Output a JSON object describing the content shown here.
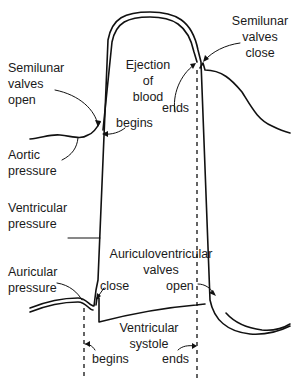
{
  "diagram": {
    "curves": {
      "aortic": "Aortic pressure",
      "ventricular": "Ventricular pressure",
      "auricular": "Auricular pressure"
    },
    "labels": {
      "semilunar_open_1": "Semilunar",
      "semilunar_open_2": "valves",
      "semilunar_open_3": "open",
      "ejection_1": "Ejection",
      "ejection_2": "of",
      "ejection_3": "blood",
      "ejection_begins": "begins",
      "ejection_ends": "ends",
      "semilunar_close_1": "Semilunar",
      "semilunar_close_2": "valves",
      "semilunar_close_3": "close",
      "aortic_1": "Aortic",
      "aortic_2": "pressure",
      "ventricular_1": "Ventricular",
      "ventricular_2": "pressure",
      "auricular_1": "Auricular",
      "auricular_2": "pressure",
      "av_valves_1": "Auriculoventricular",
      "av_valves_2": "valves",
      "av_close": "close",
      "av_open": "open",
      "systole_1": "Ventricular",
      "systole_2": "systole",
      "systole_begins": "begins",
      "systole_ends": "ends"
    },
    "colors": {
      "ink": "#111111",
      "background": "#ffffff"
    }
  }
}
